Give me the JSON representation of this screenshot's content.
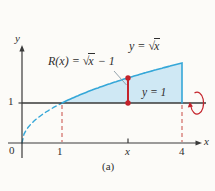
{
  "figure": {
    "caption": "(a)",
    "labels": {
      "curve_label": {
        "prefix": "y = √",
        "radicand": "x",
        "suffix": ""
      },
      "radius_label": {
        "prefix": "R(x) = √",
        "radicand": "x",
        "suffix": " − 1"
      },
      "baseline_label": "y = 1"
    },
    "axes": {
      "x_label": "x",
      "y_label": "y",
      "x_ticks": [
        "0",
        "1",
        "x",
        "4"
      ],
      "y_ticks": [
        "1"
      ]
    }
  },
  "colors": {
    "curve": "#35a7d8",
    "region_fill": "#cfe8f4",
    "red_accent": "#c4232b",
    "red_dashed": "#cd5c55",
    "axis": "#3a3a3a",
    "text": "#2f2f2f",
    "background": "#fcfbf8"
  },
  "chart_data": {
    "type": "line",
    "xlabel": "x",
    "ylabel": "y",
    "x_range": [
      0,
      4.4
    ],
    "y_range": [
      0,
      2.5
    ],
    "function": "y = sqrt(x)",
    "curve_dashed_domain": [
      0,
      1
    ],
    "curve_solid_domain": [
      1,
      4
    ],
    "horizontal_line_y": 1,
    "region_bounds": {
      "x_min": 1,
      "x_max": 4,
      "lower": "y = 1",
      "upper": "y = sqrt(x)"
    },
    "radius_sample_x": 2.65,
    "radius_formula": "R(x) = sqrt(x) - 1",
    "x_tick_values": [
      0,
      1,
      2.65,
      4
    ],
    "y_tick_values": [
      1
    ],
    "series": [
      {
        "name": "y = √x (dashed)",
        "style": "dashed",
        "x": [
          0,
          0.25,
          0.5,
          0.75,
          1
        ],
        "y": [
          0,
          0.5,
          0.71,
          0.87,
          1
        ]
      },
      {
        "name": "y = √x (solid)",
        "style": "solid",
        "x": [
          1,
          1.5,
          2,
          2.5,
          3,
          3.5,
          4
        ],
        "y": [
          1,
          1.22,
          1.41,
          1.58,
          1.73,
          1.87,
          2
        ]
      },
      {
        "name": "y = 1",
        "style": "solid",
        "x": [
          0,
          4.4
        ],
        "y": [
          1,
          1
        ]
      }
    ],
    "annotations": [
      "y = √x",
      "R(x) = √x − 1",
      "y = 1",
      "(a)",
      "revolve-about-y-equals-1 arrow at right end of line y = 1",
      "red dashed verticals at x = 1 and x = 4",
      "red radius segment with endpoint dots at generic x"
    ]
  }
}
